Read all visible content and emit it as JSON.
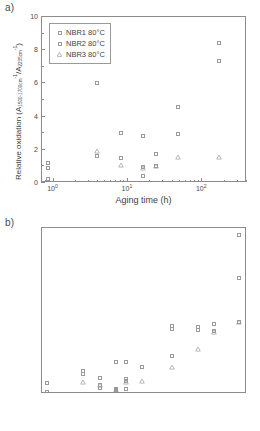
{
  "figure": {
    "panels": [
      {
        "tag": "a)",
        "legend": [
          {
            "label": "NBR1 80°C",
            "marker": "square"
          },
          {
            "label": "NBR2 80°C",
            "marker": "square"
          },
          {
            "label": "NBR3 80°C",
            "marker": "triangle"
          }
        ]
      },
      {
        "tag": "b)",
        "legend": [
          {
            "label": "NBR1 100°C",
            "marker": "square"
          },
          {
            "label": "NBR2 100°C",
            "marker": "square"
          },
          {
            "label": "NBR3 100°C",
            "marker": "triangle"
          }
        ]
      }
    ],
    "axis_title_x": "Aging time (h)",
    "axis_title_y_prefix": "Relative oxidation (A",
    "axis_title_y_sub1": "1500-1700cm",
    "axis_title_y_sup1": "-1",
    "axis_title_y_mid": "/A",
    "axis_title_y_sub2": "2235cm",
    "axis_title_y_sup2": "-1",
    "axis_title_y_suffix": ")",
    "xticklabels": [
      "10",
      "10",
      "10",
      "10"
    ],
    "xtickexps": [
      "0",
      "1",
      "2",
      "3"
    ],
    "yticklabels_a": [
      "0",
      "2",
      "4",
      "6",
      "8",
      "10"
    ],
    "yticklabels_b": [
      "0",
      "2",
      "4",
      "6",
      "8",
      "10",
      "12",
      "14",
      "16"
    ]
  },
  "chart_data": [
    {
      "type": "scatter",
      "panel": "a)",
      "title": "Relative oxidation vs aging time at 80°C",
      "xlabel": "Aging time (h)",
      "ylabel": "Relative oxidation (A_1500-1700cm-1 / A_2235cm-1)",
      "xscale": "log",
      "xlim": [
        0.7,
        400
      ],
      "ylim": [
        0,
        10
      ],
      "yticks": [
        0,
        2,
        4,
        6,
        8,
        10
      ],
      "xticks": [
        1,
        10,
        100,
        1000
      ],
      "grid": false,
      "legend_position": "upper-left-inside",
      "series": [
        {
          "name": "NBR1 80°C",
          "marker": "open-square",
          "points": [
            {
              "x": 0.85,
              "y": 1.2
            },
            {
              "x": 0.85,
              "y": 0.25
            },
            {
              "x": 3.9,
              "y": 6.05
            },
            {
              "x": 3.9,
              "y": 1.6
            },
            {
              "x": 8,
              "y": 3.0
            },
            {
              "x": 8,
              "y": 1.5
            },
            {
              "x": 16,
              "y": 2.85
            },
            {
              "x": 16,
              "y": 0.95
            },
            {
              "x": 16,
              "y": 0.4
            },
            {
              "x": 24,
              "y": 1.75
            },
            {
              "x": 47,
              "y": 4.55
            },
            {
              "x": 47,
              "y": 2.95
            },
            {
              "x": 168,
              "y": 8.45
            },
            {
              "x": 168,
              "y": 7.35
            },
            {
              "x": 500,
              "y": 8.25
            },
            {
              "x": 500,
              "y": 7.6
            },
            {
              "x": 1000,
              "y": 8.75
            },
            {
              "x": 2800,
              "y": 7.05
            },
            {
              "x": 2800,
              "y": 6.1
            }
          ]
        },
        {
          "name": "NBR2 80°C",
          "marker": "open-square",
          "points": [
            {
              "x": 0.85,
              "y": 0.9
            },
            {
              "x": 8,
              "y": 1.5
            },
            {
              "x": 16,
              "y": 0.95
            },
            {
              "x": 24,
              "y": 1.05
            }
          ]
        },
        {
          "name": "NBR3 80°C",
          "marker": "open-triangle",
          "points": [
            {
              "x": 3.9,
              "y": 1.95
            },
            {
              "x": 8,
              "y": 1.1
            },
            {
              "x": 16,
              "y": 0.9
            },
            {
              "x": 24,
              "y": 1.05
            },
            {
              "x": 47,
              "y": 1.55
            },
            {
              "x": 168,
              "y": 1.55
            },
            {
              "x": 500,
              "y": 1.55
            },
            {
              "x": 1000,
              "y": 2.25
            },
            {
              "x": 2800,
              "y": 1.5
            }
          ]
        }
      ]
    },
    {
      "type": "scatter",
      "panel": "b)",
      "title": "Relative oxidation vs aging time at 100°C",
      "xlabel": "Aging time (h)",
      "ylabel": "Relative oxidation (A_1500-1700cm-1 / A_2235cm-1)",
      "xscale": "log",
      "xlim": [
        0.7,
        4000
      ],
      "ylim": [
        0,
        16
      ],
      "yticks": [
        0,
        2,
        4,
        6,
        8,
        10,
        12,
        14,
        16
      ],
      "xticks": [
        1,
        10,
        100,
        1000
      ],
      "grid": false,
      "legend_position": "upper-left-inside",
      "series": [
        {
          "name": "NBR1 100°C",
          "marker": "open-square",
          "points": [
            {
              "x": 0.85,
              "y": 1.05
            },
            {
              "x": 0.85,
              "y": 0.2
            },
            {
              "x": 3.9,
              "y": 2.25
            },
            {
              "x": 3.9,
              "y": 1.95
            },
            {
              "x": 8,
              "y": 1.55
            },
            {
              "x": 8,
              "y": 0.85
            },
            {
              "x": 8,
              "y": 0.6
            },
            {
              "x": 16,
              "y": 3.1
            },
            {
              "x": 16,
              "y": 0.45
            },
            {
              "x": 16,
              "y": 0.25
            },
            {
              "x": 24,
              "y": 3.1
            },
            {
              "x": 24,
              "y": 1.45
            },
            {
              "x": 24,
              "y": 1.3
            },
            {
              "x": 47,
              "y": 2.65
            },
            {
              "x": 168,
              "y": 6.55
            },
            {
              "x": 168,
              "y": 3.65
            },
            {
              "x": 500,
              "y": 6.45
            },
            {
              "x": 500,
              "y": 6.15
            },
            {
              "x": 1000,
              "y": 6.75
            },
            {
              "x": 1000,
              "y": 6.05
            },
            {
              "x": 2800,
              "y": 15.35
            },
            {
              "x": 2800,
              "y": 11.15
            },
            {
              "x": 2800,
              "y": 6.95
            }
          ]
        },
        {
          "name": "NBR2 100°C",
          "marker": "open-square",
          "points": [
            {
              "x": 0.85,
              "y": 1.05
            },
            {
              "x": 8,
              "y": 0.85
            },
            {
              "x": 16,
              "y": 0.35
            },
            {
              "x": 24,
              "y": 0.45
            },
            {
              "x": 168,
              "y": 6.3
            },
            {
              "x": 500,
              "y": 6.15
            },
            {
              "x": 1000,
              "y": 6.05
            }
          ]
        },
        {
          "name": "NBR3 100°C",
          "marker": "open-triangle",
          "points": [
            {
              "x": 3.9,
              "y": 1.15
            },
            {
              "x": 8,
              "y": 0.85
            },
            {
              "x": 16,
              "y": 0.4
            },
            {
              "x": 24,
              "y": 1.2
            },
            {
              "x": 47,
              "y": 1.25
            },
            {
              "x": 168,
              "y": 2.6
            },
            {
              "x": 500,
              "y": 4.35
            },
            {
              "x": 1000,
              "y": 5.95
            },
            {
              "x": 2800,
              "y": 6.9
            }
          ]
        }
      ]
    }
  ]
}
